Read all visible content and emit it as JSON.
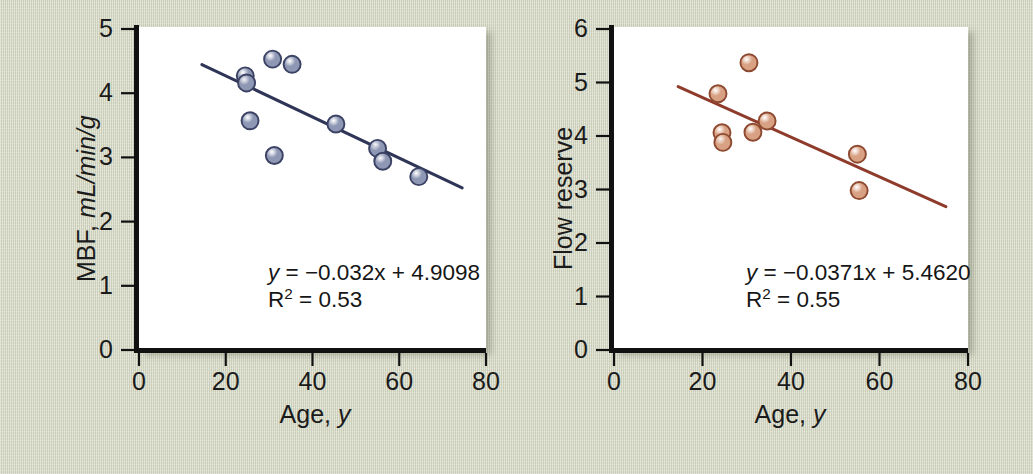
{
  "figure": {
    "background_color": "#d7dac6",
    "panel_background": "#ffffff",
    "axis_color": "#111111"
  },
  "chart_data": [
    {
      "id": "mbf-vs-age",
      "type": "scatter",
      "title": "",
      "xlabel_main": "Age, ",
      "xlabel_italic": "y",
      "ylabel_main": "MBF, ",
      "ylabel_italic": "mL/min/g",
      "xlim": [
        0,
        80
      ],
      "ylim": [
        0,
        5
      ],
      "xticks": [
        0,
        20,
        40,
        60,
        80
      ],
      "yticks": [
        0,
        1,
        2,
        3,
        4,
        5
      ],
      "xticklabels": [
        "0",
        "20",
        "40",
        "60",
        "80"
      ],
      "yticklabels": [
        "0",
        "1",
        "2",
        "3",
        "4",
        "5"
      ],
      "grid": false,
      "legend": "none",
      "marker_fill": "#8e97b4",
      "marker_edge": "#3b4263",
      "line_color": "#2f3557",
      "points": [
        {
          "x": 24.5,
          "y": 4.27
        },
        {
          "x": 24.8,
          "y": 4.16
        },
        {
          "x": 25.6,
          "y": 3.57
        },
        {
          "x": 30.8,
          "y": 4.53
        },
        {
          "x": 31.2,
          "y": 3.03
        },
        {
          "x": 35.3,
          "y": 4.45
        },
        {
          "x": 45.4,
          "y": 3.52
        },
        {
          "x": 55.0,
          "y": 3.14
        },
        {
          "x": 56.2,
          "y": 2.94
        },
        {
          "x": 64.5,
          "y": 2.7
        }
      ],
      "fit_line": {
        "slope": -0.032,
        "intercept": 4.9098,
        "x_start": 14.5,
        "x_end": 74.5
      },
      "annotations": {
        "equation_lhs": "y",
        "equation_rhs": " = −0.032x + 4.9098",
        "r2_label": "R",
        "r2_sup": "2",
        "r2_value": " = 0.53"
      }
    },
    {
      "id": "flow-reserve-vs-age",
      "type": "scatter",
      "title": "",
      "xlabel_main": "Age, ",
      "xlabel_italic": "y",
      "ylabel_main": "Flow reserve",
      "ylabel_italic": "",
      "xlim": [
        0,
        80
      ],
      "ylim": [
        0,
        6
      ],
      "xticks": [
        0,
        20,
        40,
        60,
        80
      ],
      "yticks": [
        0,
        1,
        2,
        3,
        4,
        5,
        6
      ],
      "xticklabels": [
        "0",
        "20",
        "40",
        "60",
        "80"
      ],
      "yticklabels": [
        "0",
        "1",
        "2",
        "3",
        "4",
        "5",
        "6"
      ],
      "grid": false,
      "legend": "none",
      "marker_fill": "#d9a183",
      "marker_edge": "#8e4a30",
      "line_color": "#8e3b2c",
      "points": [
        {
          "x": 23.5,
          "y": 4.79
        },
        {
          "x": 24.4,
          "y": 4.06
        },
        {
          "x": 24.6,
          "y": 3.88
        },
        {
          "x": 30.5,
          "y": 5.37
        },
        {
          "x": 31.4,
          "y": 4.07
        },
        {
          "x": 34.6,
          "y": 4.28
        },
        {
          "x": 55.0,
          "y": 3.66
        },
        {
          "x": 55.4,
          "y": 2.98
        }
      ],
      "fit_line": {
        "slope": -0.0371,
        "intercept": 5.462,
        "x_start": 14.5,
        "x_end": 75.0
      },
      "annotations": {
        "equation_lhs": "y",
        "equation_rhs": " = −0.0371x + 5.4620",
        "r2_label": "R",
        "r2_sup": "2",
        "r2_value": " = 0.55"
      }
    }
  ]
}
